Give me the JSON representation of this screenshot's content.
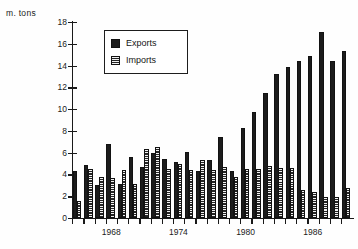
{
  "unit_label": "m. tons",
  "legend": {
    "position": "upper-left-inside",
    "items": [
      {
        "label": "Exports",
        "pattern": "solid-black",
        "color": "#1c1c1c"
      },
      {
        "label": "Imports",
        "pattern": "horizontal-hatch",
        "color": "#3a3a3a"
      }
    ]
  },
  "axes": {
    "y_ticks": [
      0,
      2,
      4,
      6,
      8,
      10,
      12,
      14,
      16,
      18
    ],
    "y_tick_labels": [
      "0",
      "2",
      "4",
      "6",
      "8",
      "10",
      "12",
      "14",
      "16",
      "18"
    ],
    "ylim": [
      0,
      18
    ],
    "x_tick_labels": [
      "1968",
      "1974",
      "1980",
      "1986"
    ],
    "x_tick_years": [
      1968,
      1974,
      1980,
      1986
    ],
    "grid": false
  },
  "chart_data": {
    "type": "bar",
    "title": "",
    "subtitle": "",
    "xlabel": "",
    "ylabel": "m. tons",
    "ylim": [
      0,
      18
    ],
    "grid": false,
    "legend_position": "upper-left-inside",
    "categories": [
      "1965",
      "1966",
      "1967",
      "1968",
      "1969",
      "1970",
      "1971",
      "1972",
      "1973",
      "1974",
      "1975",
      "1976",
      "1977",
      "1978",
      "1979",
      "1980",
      "1981",
      "1982",
      "1983",
      "1984",
      "1985",
      "1986",
      "1987",
      "1988",
      "1989"
    ],
    "series": [
      {
        "name": "Exports",
        "values": [
          4.3,
          4.9,
          3.0,
          6.8,
          3.1,
          5.6,
          4.7,
          6.0,
          5.4,
          5.1,
          6.1,
          4.3,
          5.3,
          7.4,
          4.3,
          8.3,
          9.7,
          11.5,
          13.2,
          13.9,
          14.4,
          14.9,
          17.1,
          14.4,
          15.3
        ]
      },
      {
        "name": "Imports",
        "values": [
          1.6,
          4.5,
          3.8,
          3.7,
          4.4,
          3.1,
          6.3,
          6.5,
          4.5,
          5.0,
          4.4,
          5.3,
          4.4,
          4.7,
          3.8,
          4.5,
          4.5,
          4.8,
          4.6,
          4.6,
          2.6,
          2.4,
          1.9,
          1.9,
          2.8
        ]
      }
    ]
  }
}
